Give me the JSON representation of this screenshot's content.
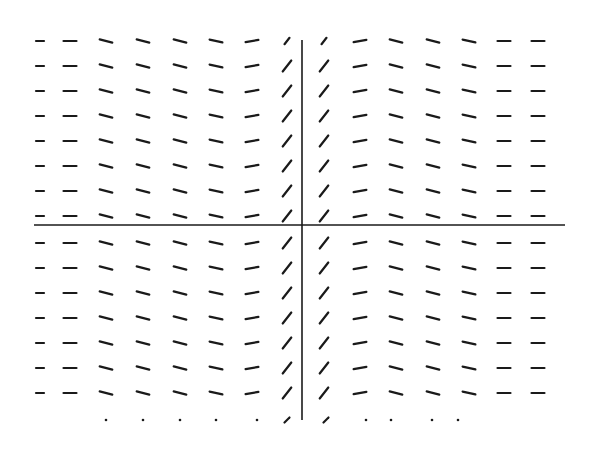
{
  "figure": {
    "title": "",
    "colors": {
      "ink": "#1a1a1a",
      "background": "#ffffff"
    }
  },
  "axes": {
    "x_axis": {
      "y": 225,
      "x1": 34,
      "x2": 565
    },
    "y_axis": {
      "x": 302,
      "y1": 40,
      "y2": 420
    }
  },
  "grid": {
    "columns": [
      {
        "x": 40,
        "angle_deg": 0,
        "len": 8
      },
      {
        "x": 70,
        "angle_deg": 0,
        "len": 13
      },
      {
        "x": 106,
        "angle_deg": 14,
        "len": 13
      },
      {
        "x": 143,
        "angle_deg": 14,
        "len": 13
      },
      {
        "x": 180,
        "angle_deg": 14,
        "len": 13
      },
      {
        "x": 216,
        "angle_deg": 12,
        "len": 13
      },
      {
        "x": 252,
        "angle_deg": -10,
        "len": 13
      },
      {
        "x": 287,
        "angle_deg": -52,
        "len": 14
      },
      {
        "x": 324,
        "angle_deg": -52,
        "len": 14
      },
      {
        "x": 360,
        "angle_deg": -10,
        "len": 13
      },
      {
        "x": 396,
        "angle_deg": 14,
        "len": 13
      },
      {
        "x": 433,
        "angle_deg": 14,
        "len": 13
      },
      {
        "x": 469,
        "angle_deg": 12,
        "len": 13
      },
      {
        "x": 504,
        "angle_deg": 0,
        "len": 13
      },
      {
        "x": 538,
        "angle_deg": 0,
        "len": 13
      }
    ],
    "rows": [
      41,
      66,
      91,
      116,
      141,
      166,
      191,
      216,
      243,
      268,
      293,
      318,
      343,
      368,
      393
    ],
    "partial_bottom_row": {
      "y": 420,
      "marks": [
        {
          "x": 106,
          "type": "dot"
        },
        {
          "x": 143,
          "type": "dot"
        },
        {
          "x": 180,
          "type": "dot"
        },
        {
          "x": 216,
          "type": "dot"
        },
        {
          "x": 257,
          "type": "dot"
        },
        {
          "x": 287,
          "type": "short",
          "angle_deg": -45,
          "len": 7
        },
        {
          "x": 326,
          "type": "short",
          "angle_deg": -45,
          "len": 7
        },
        {
          "x": 366,
          "type": "dot"
        },
        {
          "x": 391,
          "type": "dot"
        },
        {
          "x": 432,
          "type": "dot"
        },
        {
          "x": 458,
          "type": "dot"
        }
      ]
    },
    "top_row_overrides": [
      {
        "col": 7,
        "len": 8
      },
      {
        "col": 8,
        "len": 8
      }
    ]
  }
}
